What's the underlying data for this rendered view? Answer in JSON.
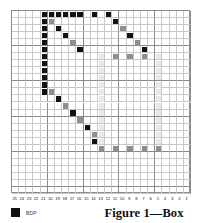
{
  "figure": {
    "caption": "Figure 1—Box"
  },
  "legend": {
    "swatch_icon": "filled-square-icon",
    "label": "BDP",
    "swatch_color": "#101010"
  },
  "grid": {
    "columns": 25,
    "rows": 26,
    "x_axis_labels": [
      "25",
      "24",
      "23",
      "22",
      "21",
      "20",
      "19",
      "18",
      "17",
      "16",
      "15",
      "14",
      "13",
      "12",
      "11",
      "10",
      "9",
      "8",
      "7",
      "6",
      "5",
      "4",
      "3",
      "2",
      "1"
    ],
    "line_color": "#c9c9c9",
    "major_line_color": "#8a8a8a",
    "border_color": "#8c8c8c",
    "background": "#ffffff"
  },
  "chart_data": {
    "type": "heatmap",
    "title": "Figure 1—Box",
    "xlabel": "",
    "ylabel": "",
    "grid": true,
    "legend_position": "bottom-left",
    "x": [
      "25",
      "24",
      "23",
      "22",
      "21",
      "20",
      "19",
      "18",
      "17",
      "16",
      "15",
      "14",
      "13",
      "12",
      "11",
      "10",
      "9",
      "8",
      "7",
      "6",
      "5",
      "4",
      "3",
      "2",
      "1"
    ],
    "ncols": 25,
    "nrows": 26,
    "value_levels": {
      "dark": "#121212",
      "mid": "#8e8e8e",
      "faint": "#e8e8e8",
      "empty": "#ffffff"
    },
    "legend_entries": [
      {
        "label": "BDP",
        "color": "#101010"
      }
    ],
    "cells": [
      {
        "col": 5,
        "row": 1,
        "level": "dark"
      },
      {
        "col": 6,
        "row": 1,
        "level": "dark"
      },
      {
        "col": 7,
        "row": 1,
        "level": "dark"
      },
      {
        "col": 8,
        "row": 1,
        "level": "dark"
      },
      {
        "col": 9,
        "row": 1,
        "level": "dark"
      },
      {
        "col": 10,
        "row": 1,
        "level": "dark"
      },
      {
        "col": 12,
        "row": 1,
        "level": "dark"
      },
      {
        "col": 14,
        "row": 1,
        "level": "dark"
      },
      {
        "col": 5,
        "row": 2,
        "level": "dark"
      },
      {
        "col": 6,
        "row": 2,
        "level": "mid"
      },
      {
        "col": 15,
        "row": 2,
        "level": "dark"
      },
      {
        "col": 5,
        "row": 3,
        "level": "dark"
      },
      {
        "col": 7,
        "row": 3,
        "level": "dark"
      },
      {
        "col": 16,
        "row": 3,
        "level": "mid"
      },
      {
        "col": 5,
        "row": 4,
        "level": "dark"
      },
      {
        "col": 8,
        "row": 4,
        "level": "dark"
      },
      {
        "col": 17,
        "row": 4,
        "level": "dark"
      },
      {
        "col": 5,
        "row": 5,
        "level": "dark"
      },
      {
        "col": 9,
        "row": 5,
        "level": "mid"
      },
      {
        "col": 18,
        "row": 5,
        "level": "mid"
      },
      {
        "col": 5,
        "row": 6,
        "level": "dark"
      },
      {
        "col": 10,
        "row": 6,
        "level": "dark"
      },
      {
        "col": 19,
        "row": 6,
        "level": "dark"
      },
      {
        "col": 5,
        "row": 7,
        "level": "dark"
      },
      {
        "col": 13,
        "row": 7,
        "level": "faint"
      },
      {
        "col": 15,
        "row": 7,
        "level": "mid"
      },
      {
        "col": 17,
        "row": 7,
        "level": "mid"
      },
      {
        "col": 19,
        "row": 7,
        "level": "mid"
      },
      {
        "col": 21,
        "row": 7,
        "level": "faint"
      },
      {
        "col": 5,
        "row": 8,
        "level": "dark"
      },
      {
        "col": 13,
        "row": 8,
        "level": "faint"
      },
      {
        "col": 21,
        "row": 8,
        "level": "faint"
      },
      {
        "col": 5,
        "row": 9,
        "level": "dark"
      },
      {
        "col": 13,
        "row": 9,
        "level": "faint"
      },
      {
        "col": 21,
        "row": 9,
        "level": "faint"
      },
      {
        "col": 5,
        "row": 10,
        "level": "dark"
      },
      {
        "col": 13,
        "row": 10,
        "level": "faint"
      },
      {
        "col": 21,
        "row": 10,
        "level": "faint"
      },
      {
        "col": 5,
        "row": 11,
        "level": "dark"
      },
      {
        "col": 13,
        "row": 11,
        "level": "faint"
      },
      {
        "col": 21,
        "row": 11,
        "level": "faint"
      },
      {
        "col": 5,
        "row": 12,
        "level": "dark"
      },
      {
        "col": 6,
        "row": 12,
        "level": "mid"
      },
      {
        "col": 13,
        "row": 12,
        "level": "faint"
      },
      {
        "col": 21,
        "row": 12,
        "level": "faint"
      },
      {
        "col": 7,
        "row": 13,
        "level": "dark"
      },
      {
        "col": 13,
        "row": 13,
        "level": "faint"
      },
      {
        "col": 21,
        "row": 13,
        "level": "faint"
      },
      {
        "col": 8,
        "row": 14,
        "level": "mid"
      },
      {
        "col": 13,
        "row": 14,
        "level": "faint"
      },
      {
        "col": 21,
        "row": 14,
        "level": "faint"
      },
      {
        "col": 9,
        "row": 15,
        "level": "dark"
      },
      {
        "col": 13,
        "row": 15,
        "level": "faint"
      },
      {
        "col": 21,
        "row": 15,
        "level": "faint"
      },
      {
        "col": 10,
        "row": 16,
        "level": "mid"
      },
      {
        "col": 13,
        "row": 16,
        "level": "faint"
      },
      {
        "col": 21,
        "row": 16,
        "level": "faint"
      },
      {
        "col": 11,
        "row": 17,
        "level": "dark"
      },
      {
        "col": 13,
        "row": 17,
        "level": "faint"
      },
      {
        "col": 21,
        "row": 17,
        "level": "faint"
      },
      {
        "col": 12,
        "row": 18,
        "level": "mid"
      },
      {
        "col": 13,
        "row": 18,
        "level": "faint"
      },
      {
        "col": 21,
        "row": 18,
        "level": "faint"
      },
      {
        "col": 12,
        "row": 19,
        "level": "dark"
      },
      {
        "col": 13,
        "row": 19,
        "level": "faint"
      },
      {
        "col": 21,
        "row": 19,
        "level": "faint"
      },
      {
        "col": 13,
        "row": 20,
        "level": "mid"
      },
      {
        "col": 15,
        "row": 20,
        "level": "mid"
      },
      {
        "col": 17,
        "row": 20,
        "level": "mid"
      },
      {
        "col": 19,
        "row": 20,
        "level": "mid"
      },
      {
        "col": 21,
        "row": 20,
        "level": "mid"
      }
    ]
  }
}
